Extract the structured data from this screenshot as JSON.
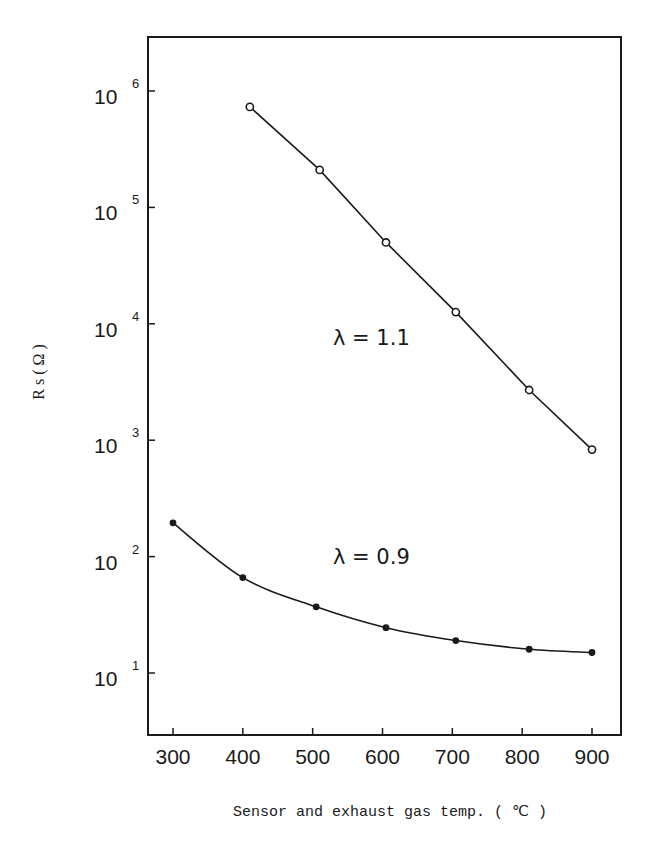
{
  "chart_data": {
    "type": "line",
    "title": "",
    "xlabel": "Sensor and exhaust gas temp. ( ℃ )",
    "ylabel": "R s ( Ω )",
    "xlim": [
      270,
      950
    ],
    "ylim_log10": [
      0.45,
      6.45
    ],
    "yscale": "log",
    "grid": false,
    "x_ticks": [
      300,
      400,
      500,
      600,
      700,
      800,
      900
    ],
    "x_tick_labels": [
      "300",
      "400",
      "500",
      "600",
      "700",
      "800",
      "900"
    ],
    "y_ticks": [
      {
        "base": "10",
        "exp": "1",
        "value": 10
      },
      {
        "base": "10",
        "exp": "2",
        "value": 100
      },
      {
        "base": "10",
        "exp": "3",
        "value": 1000
      },
      {
        "base": "10",
        "exp": "4",
        "value": 10000
      },
      {
        "base": "10",
        "exp": "5",
        "value": 100000
      },
      {
        "base": "10",
        "exp": "6",
        "value": 1000000
      }
    ],
    "series": [
      {
        "name": "λ = 1.1",
        "marker": "open-circle",
        "x": [
          410,
          510,
          605,
          705,
          810,
          900
        ],
        "y": [
          730000,
          210000,
          50000,
          12600,
          2700,
          830
        ]
      },
      {
        "name": "λ = 0.9",
        "marker": "filled-circle",
        "x": [
          300,
          400,
          505,
          605,
          705,
          810,
          900
        ],
        "y": [
          195,
          66,
          37,
          24.5,
          19,
          16,
          15
        ]
      }
    ],
    "annotations": [
      {
        "text": "λ = 1.1",
        "x": 710,
        "y": 8000
      },
      {
        "text": "λ = 0.9",
        "x": 710,
        "y": 110
      }
    ]
  }
}
